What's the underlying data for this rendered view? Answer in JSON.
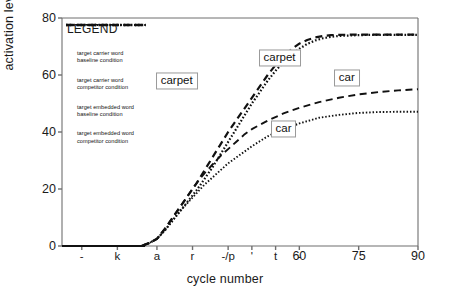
{
  "chart_data": {
    "type": "line",
    "title": "",
    "xlabel": "cycle number",
    "ylabel": "activation level",
    "xlim": [
      0,
      90
    ],
    "ylim": [
      0,
      80
    ],
    "grid": false,
    "yticks": [
      0,
      20,
      40,
      60,
      80
    ],
    "ytick_labels": [
      "0",
      "20",
      "40",
      "60",
      "80"
    ],
    "xticks": [
      5,
      15,
      24,
      33,
      42,
      48,
      54,
      60,
      75,
      90
    ],
    "xtick_labels": [
      "-",
      "k",
      "a",
      "r",
      "-/p",
      "'",
      "t",
      "-",
      "60",
      "75",
      "90"
    ],
    "xtick_positions": [
      5,
      14,
      24,
      33,
      42,
      48,
      54,
      60,
      60,
      75,
      90
    ],
    "legend_position": "upper-left-inside",
    "series": [
      {
        "name": "target carrier word baseline condition",
        "label": "carpet",
        "style": "dashed",
        "width": "thick",
        "x": [
          0,
          20,
          22,
          24,
          26,
          28,
          30,
          32,
          34,
          36,
          38,
          40,
          42,
          44,
          46,
          48,
          50,
          52,
          54,
          56,
          58,
          60,
          62,
          64,
          66,
          68,
          70,
          75,
          80,
          85,
          90
        ],
        "y": [
          0,
          0,
          1,
          2.5,
          6,
          10,
          14,
          18,
          22,
          26.5,
          31,
          35.5,
          40,
          44,
          48,
          52,
          56,
          60,
          63.5,
          66.5,
          69,
          71,
          72.3,
          73.2,
          73.7,
          74,
          74.1,
          74.2,
          74.2,
          74.2,
          74.2
        ]
      },
      {
        "name": "target carrier word competitor condition",
        "label": "carpet",
        "style": "dotted",
        "width": "thick",
        "x": [
          0,
          20,
          22,
          24,
          26,
          28,
          30,
          32,
          34,
          36,
          38,
          40,
          42,
          44,
          46,
          48,
          50,
          52,
          54,
          56,
          58,
          60,
          62,
          64,
          66,
          68,
          70,
          75,
          80,
          85,
          90
        ],
        "y": [
          0,
          0,
          1,
          2.5,
          5.5,
          9,
          12.5,
          16,
          19.5,
          23.5,
          27.5,
          32,
          36.5,
          41,
          45.5,
          50,
          54,
          58,
          61.5,
          64.5,
          67,
          69.2,
          70.9,
          72.1,
          72.9,
          73.4,
          73.7,
          74,
          74.1,
          74.1,
          74.1
        ]
      },
      {
        "name": "target embedded word baseline condition",
        "label": "car",
        "style": "dashed",
        "width": "thin",
        "x": [
          0,
          20,
          22,
          24,
          26,
          28,
          30,
          32,
          34,
          36,
          38,
          40,
          42,
          44,
          46,
          48,
          52,
          56,
          60,
          65,
          70,
          75,
          80,
          85,
          90
        ],
        "y": [
          0,
          0,
          1,
          2.5,
          6,
          10,
          14,
          18,
          22,
          25.5,
          28.5,
          31.5,
          34,
          36.5,
          39,
          41,
          44,
          46.5,
          48.5,
          50.5,
          52,
          53.2,
          54,
          54.6,
          55
        ]
      },
      {
        "name": "target embedded word competitor condition",
        "label": "car",
        "style": "dotted",
        "width": "thin",
        "x": [
          0,
          20,
          22,
          24,
          26,
          28,
          30,
          32,
          34,
          36,
          38,
          40,
          42,
          44,
          46,
          48,
          52,
          56,
          60,
          65,
          70,
          75,
          80,
          85,
          90
        ],
        "y": [
          0,
          0,
          1,
          2.5,
          5.5,
          9,
          12.5,
          15.5,
          18.5,
          21.5,
          24,
          26.5,
          29,
          31,
          33,
          35,
          38.5,
          41,
          43,
          45,
          46,
          46.7,
          47,
          47.1,
          47.1
        ]
      }
    ],
    "annotations": [
      {
        "text": "carpet",
        "x": 29,
        "y": 58
      },
      {
        "text": "carpet",
        "x": 55,
        "y": 66
      },
      {
        "text": "car",
        "x": 72,
        "y": 59
      },
      {
        "text": "car",
        "x": 56,
        "y": 41
      }
    ]
  },
  "legend": {
    "title": "LEGEND",
    "entries": [
      {
        "line1": "target carrier word",
        "line2": "baseline condition",
        "style": "dashed",
        "width": "thick"
      },
      {
        "line1": "target carrier word",
        "line2": "competitor condition",
        "style": "dotted",
        "width": "thick"
      },
      {
        "line1": "target embedded word",
        "line2": "baseline condition",
        "style": "dashed",
        "width": "thin"
      },
      {
        "line1": "target embedded word",
        "line2": "competitor condition",
        "style": "dotted",
        "width": "thin"
      }
    ]
  },
  "colors": {
    "line": "#111111",
    "axis": "#6f6f6f",
    "background": "#ffffff",
    "box_border": "#9a9a9a"
  }
}
